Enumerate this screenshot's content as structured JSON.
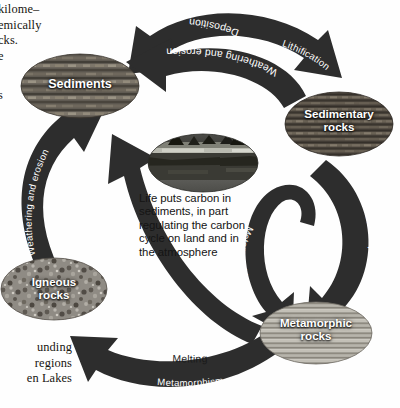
{
  "figure": {
    "type": "cycle-diagram",
    "background_color": "#ffffff",
    "arrow_color": "#2b2b2b"
  },
  "margin_text": {
    "top_left_lines": [
      "kilome–",
      "emically",
      "cks.",
      "e",
      "s"
    ],
    "bottom_left_lines": [
      "unding",
      "regions",
      "en Lakes"
    ]
  },
  "center": {
    "photo_name": "landscape-life-photo",
    "caption": "Life puts carbon in sediments, in part regulating the carbon cycle on land and in the atmosphere",
    "caption_lines": [
      "Life puts carbon in",
      "sediments, in part",
      "regulating the carbon",
      "cycle on land and in",
      "the atmosphere"
    ]
  },
  "nodes": [
    {
      "id": "sediments",
      "label": "Sediments",
      "label_lines": [
        "Sediments"
      ],
      "texture": "layered-sediment",
      "cx": 80,
      "cy": 86,
      "rx": 59,
      "ry": 32
    },
    {
      "id": "sedimentary",
      "label": "Sedimentary rocks",
      "label_lines": [
        "Sedimentary",
        "rocks"
      ],
      "texture": "bedded-rock",
      "cx": 339,
      "cy": 124,
      "rx": 54,
      "ry": 32
    },
    {
      "id": "metamorphic",
      "label": "Metamorphic rocks",
      "label_lines": [
        "Metamorphic",
        "rocks"
      ],
      "texture": "banded-gneiss",
      "cx": 316,
      "cy": 333,
      "rx": 56,
      "ry": 31
    },
    {
      "id": "igneous",
      "label": "Igneous rocks",
      "label_lines": [
        "Igneous",
        "rocks"
      ],
      "texture": "speckled-granite",
      "cx": 54,
      "cy": 289,
      "rx": 53,
      "ry": 31
    }
  ],
  "arrows": [
    {
      "id": "deposition",
      "label": "Deposition",
      "from": "sedimentary-area",
      "to": "sediments",
      "text_color": "#ffffff",
      "position": "top-outer-arc"
    },
    {
      "id": "lithification",
      "label": "Lithification",
      "from": "sediments",
      "to": "sedimentary",
      "text_color": "#ffffff",
      "position": "top-outer-arc-right"
    },
    {
      "id": "weathering-top",
      "label": "Weathering and erosion",
      "from": "sedimentary",
      "to": "sediments",
      "text_color": "#ffffff",
      "position": "top-inner-arc"
    },
    {
      "id": "weathering-left",
      "label": "Weathering and erosion",
      "from": "igneous",
      "to": "sediments",
      "text_color": "#ffffff",
      "position": "left-arc"
    },
    {
      "id": "weathering-diagonal",
      "label": "Weathering and erosion",
      "from": "metamorphic",
      "to": "sediments",
      "text_color": "#ffffff",
      "position": "center-diagonal-arc"
    },
    {
      "id": "metamorphism-right",
      "label": "Metamorphism",
      "from": "sedimentary",
      "to": "metamorphic",
      "text_color": "#ffffff",
      "position": "right-arc"
    },
    {
      "id": "metamorphism-loop",
      "label": "Metamorphism",
      "from": "metamorphic",
      "to": "metamorphic",
      "text_color": "#ffffff",
      "position": "hook-loop"
    },
    {
      "id": "melting",
      "label": "Melting",
      "from": "metamorphic",
      "to": "igneous",
      "text_color": "#1a1a1a",
      "position": "bottom-above-arc"
    },
    {
      "id": "metamorphism-bottom",
      "label": "Metamorphism",
      "from": "igneous",
      "to": "metamorphic",
      "text_color": "#ffffff",
      "position": "bottom-arc"
    }
  ]
}
